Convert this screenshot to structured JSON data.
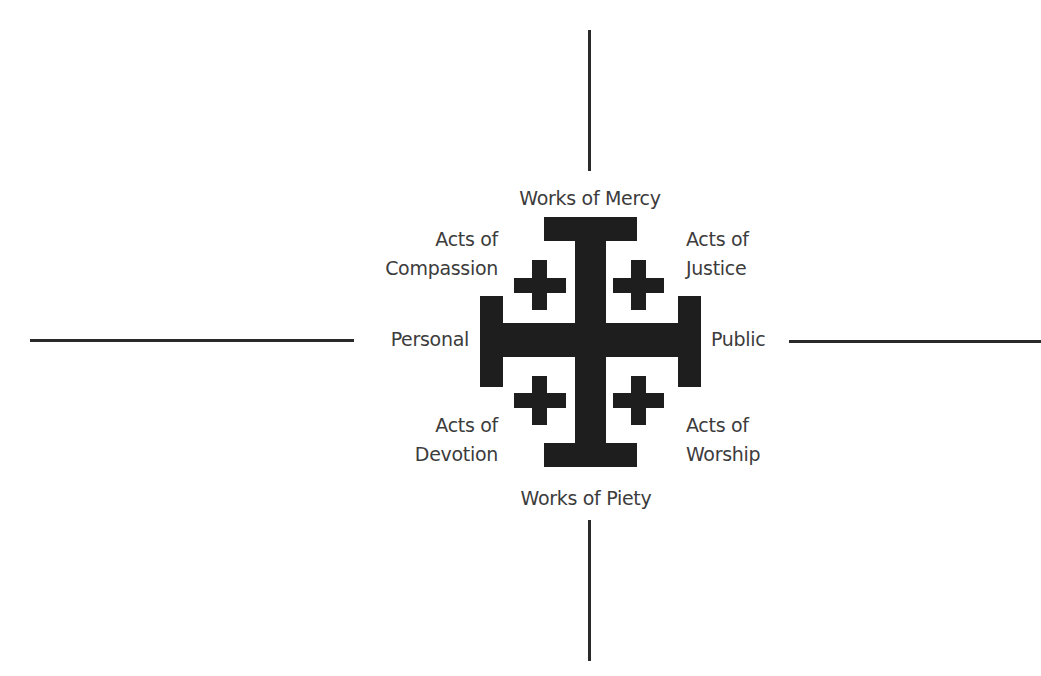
{
  "diagram": {
    "type": "jerusalem-cross-quadrant-diagram",
    "colors": {
      "cross": "#1e1e1e",
      "lines": "#2a2a2a",
      "text": "#3c3c3c",
      "background": "#ffffff"
    },
    "axes": {
      "top": "Works of Mercy",
      "bottom": "Works of Piety",
      "left": "Personal",
      "right": "Public"
    },
    "quadrants": {
      "top_left": {
        "line1": "Acts of",
        "line2": "Compassion"
      },
      "top_right": {
        "line1": "Acts of",
        "line2": "Justice"
      },
      "bottom_left": {
        "line1": "Acts of",
        "line2": "Devotion"
      },
      "bottom_right": {
        "line1": "Acts of",
        "line2": "Worship"
      }
    },
    "center_icon": "jerusalem-cross-icon"
  }
}
